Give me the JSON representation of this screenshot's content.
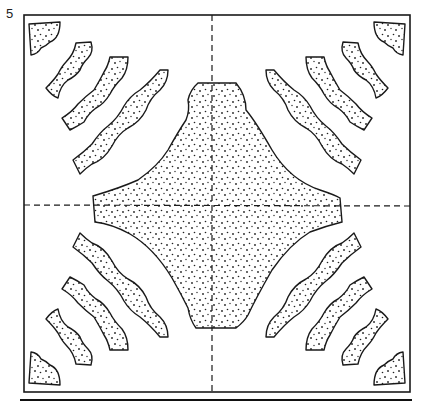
{
  "figure": {
    "number": "5"
  },
  "colors": {
    "ink": "#1a1a1a",
    "background": "#ffffff"
  }
}
